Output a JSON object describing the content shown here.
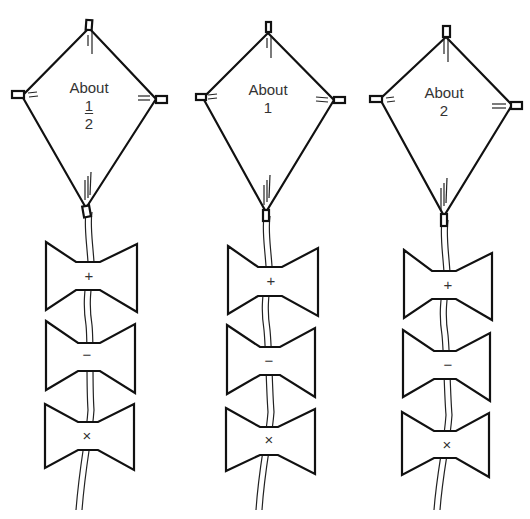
{
  "kites": [
    {
      "id": "kite-1",
      "label_line1": "About",
      "label_num": "1",
      "label_den": "2",
      "is_fraction": true,
      "tails": [
        {
          "symbol": "+"
        },
        {
          "symbol": "−"
        },
        {
          "symbol": "×"
        }
      ]
    },
    {
      "id": "kite-2",
      "label_line1": "About",
      "label_value": "1",
      "is_fraction": false,
      "tails": [
        {
          "symbol": "+"
        },
        {
          "symbol": "−"
        },
        {
          "symbol": "×"
        }
      ]
    },
    {
      "id": "kite-3",
      "label_line1": "About",
      "label_value": "2",
      "is_fraction": false,
      "tails": [
        {
          "symbol": "+"
        },
        {
          "symbol": "−"
        },
        {
          "symbol": "×"
        }
      ]
    }
  ],
  "colors": {
    "line": "#111111",
    "text": "#333333",
    "background": "#ffffff"
  }
}
